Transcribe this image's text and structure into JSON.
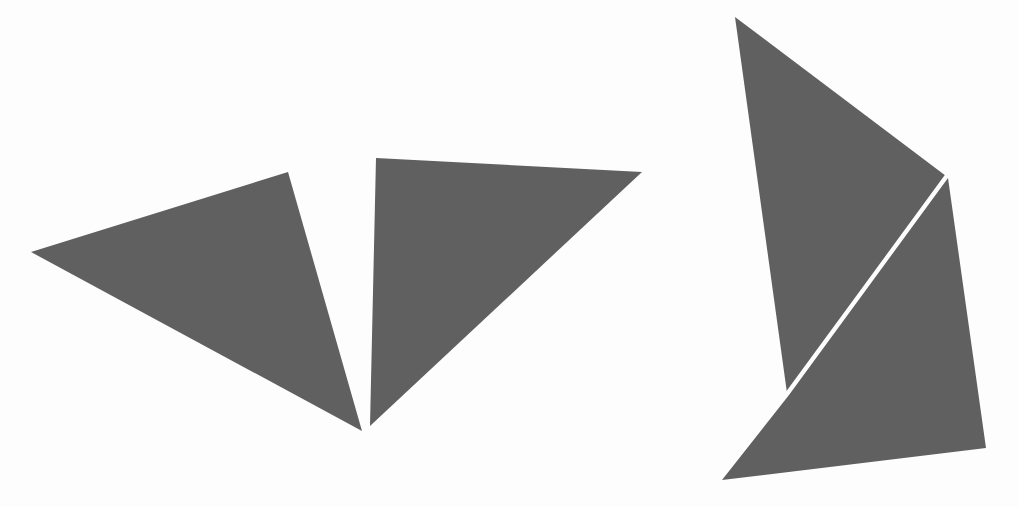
{
  "figure": {
    "width": 1018,
    "height": 507,
    "background_color": "#ffffff",
    "fill_color": "#616161",
    "separator_color": "#ffffff",
    "separator_width": 3
  },
  "groups": [
    {
      "name": "left-group",
      "label": "Left arrowhead pair",
      "shapes": [
        {
          "name": "left-wing-triangle",
          "label": "Left wing triangle",
          "type": "polygon",
          "fill": "#616161",
          "points": "31,252 288,172 362,431"
        },
        {
          "name": "right-wing-triangle",
          "label": "Right wing triangle",
          "type": "polygon",
          "fill": "#616161",
          "points": "376,158 642,172 370,426"
        }
      ]
    },
    {
      "name": "right-group",
      "label": "Right split quadrilateral",
      "shapes": [
        {
          "name": "upper-right-triangle",
          "label": "Upper triangle of split quadrilateral",
          "type": "polygon",
          "fill": "#616161",
          "points": "735,17 946,176 787,393"
        },
        {
          "name": "lower-right-triangle",
          "label": "Lower triangle of split quadrilateral",
          "type": "polygon",
          "fill": "#616161",
          "points": "948,178 986,448 722,480 789,395"
        }
      ]
    }
  ],
  "separators": [
    {
      "name": "diagonal-white-separator",
      "label": "White diagonal gap between right triangles",
      "type": "line",
      "stroke": "#ffffff",
      "width": 3,
      "x1": 946,
      "y1": 176,
      "x2": 787,
      "y2": 393
    }
  ]
}
